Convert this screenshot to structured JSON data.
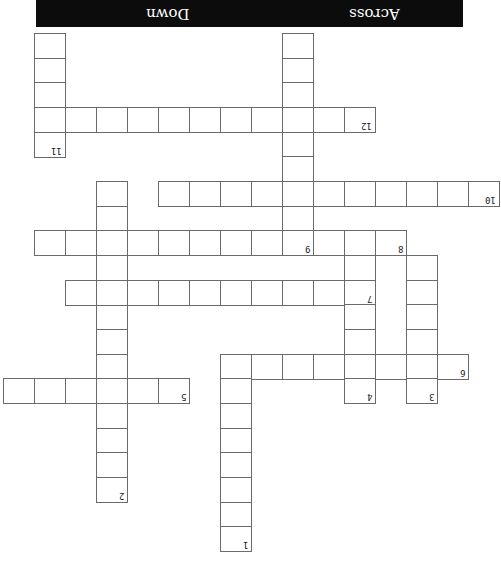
{
  "header": {
    "left_label": "Down",
    "right_label": "Across",
    "background": "#0c0c0c",
    "text_color": "#ffffff"
  },
  "orientation": "rotated-180",
  "cell_size": {
    "w": 31,
    "h": 24.6
  },
  "clues": [
    {
      "number": "1",
      "direction": "down"
    },
    {
      "number": "2",
      "direction": "down"
    },
    {
      "number": "3",
      "direction": "down"
    },
    {
      "number": "4",
      "direction": "down"
    },
    {
      "number": "5",
      "direction": "across"
    },
    {
      "number": "6",
      "direction": "across"
    },
    {
      "number": "7",
      "direction": "across"
    },
    {
      "number": "8",
      "direction": "down"
    },
    {
      "number": "9",
      "direction": "across"
    },
    {
      "number": "10",
      "direction": "across"
    },
    {
      "number": "11",
      "direction": "down"
    },
    {
      "number": "12",
      "direction": "across"
    }
  ],
  "cells": [
    {
      "x": 34,
      "y": 33
    },
    {
      "x": 34,
      "y": 58
    },
    {
      "x": 34,
      "y": 82
    },
    {
      "x": 34,
      "y": 107
    },
    {
      "x": 34,
      "y": 132,
      "n": "11"
    },
    {
      "x": 65,
      "y": 107
    },
    {
      "x": 96,
      "y": 107
    },
    {
      "x": 127,
      "y": 107
    },
    {
      "x": 158,
      "y": 107
    },
    {
      "x": 189,
      "y": 107
    },
    {
      "x": 220,
      "y": 107
    },
    {
      "x": 251,
      "y": 107
    },
    {
      "x": 282,
      "y": 107
    },
    {
      "x": 313,
      "y": 107
    },
    {
      "x": 344,
      "y": 107,
      "n": "12"
    },
    {
      "x": 282,
      "y": 33
    },
    {
      "x": 282,
      "y": 58
    },
    {
      "x": 282,
      "y": 82
    },
    {
      "x": 282,
      "y": 132
    },
    {
      "x": 282,
      "y": 156
    },
    {
      "x": 282,
      "y": 205
    },
    {
      "x": 158,
      "y": 181
    },
    {
      "x": 189,
      "y": 181
    },
    {
      "x": 220,
      "y": 181
    },
    {
      "x": 251,
      "y": 181
    },
    {
      "x": 282,
      "y": 181
    },
    {
      "x": 313,
      "y": 181
    },
    {
      "x": 344,
      "y": 181
    },
    {
      "x": 375,
      "y": 181
    },
    {
      "x": 406,
      "y": 181
    },
    {
      "x": 437,
      "y": 181
    },
    {
      "x": 468,
      "y": 181,
      "n": "10"
    },
    {
      "x": 96,
      "y": 181
    },
    {
      "x": 96,
      "y": 206
    },
    {
      "x": 96,
      "y": 255
    },
    {
      "x": 96,
      "y": 304
    },
    {
      "x": 96,
      "y": 329
    },
    {
      "x": 96,
      "y": 354
    },
    {
      "x": 96,
      "y": 403
    },
    {
      "x": 96,
      "y": 428
    },
    {
      "x": 96,
      "y": 452
    },
    {
      "x": 96,
      "y": 477,
      "n": "2"
    },
    {
      "x": 34,
      "y": 230
    },
    {
      "x": 65,
      "y": 230
    },
    {
      "x": 96,
      "y": 230
    },
    {
      "x": 127,
      "y": 230
    },
    {
      "x": 158,
      "y": 230
    },
    {
      "x": 189,
      "y": 230
    },
    {
      "x": 220,
      "y": 230
    },
    {
      "x": 251,
      "y": 230
    },
    {
      "x": 282,
      "y": 230,
      "n": "9"
    },
    {
      "x": 313,
      "y": 230
    },
    {
      "x": 344,
      "y": 230
    },
    {
      "x": 375,
      "y": 230,
      "n": "8"
    },
    {
      "x": 65,
      "y": 280
    },
    {
      "x": 96,
      "y": 280
    },
    {
      "x": 127,
      "y": 280
    },
    {
      "x": 158,
      "y": 280
    },
    {
      "x": 189,
      "y": 280
    },
    {
      "x": 220,
      "y": 280
    },
    {
      "x": 251,
      "y": 280
    },
    {
      "x": 282,
      "y": 280
    },
    {
      "x": 313,
      "y": 280
    },
    {
      "x": 344,
      "y": 280,
      "n": "7"
    },
    {
      "x": 344,
      "y": 255
    },
    {
      "x": 344,
      "y": 304
    },
    {
      "x": 344,
      "y": 329
    },
    {
      "x": 344,
      "y": 354
    },
    {
      "x": 344,
      "y": 378,
      "n": "4"
    },
    {
      "x": 406,
      "y": 255
    },
    {
      "x": 406,
      "y": 280
    },
    {
      "x": 406,
      "y": 304
    },
    {
      "x": 406,
      "y": 329
    },
    {
      "x": 406,
      "y": 354
    },
    {
      "x": 406,
      "y": 378,
      "n": "3"
    },
    {
      "x": 220,
      "y": 354
    },
    {
      "x": 251,
      "y": 354
    },
    {
      "x": 282,
      "y": 354
    },
    {
      "x": 313,
      "y": 354
    },
    {
      "x": 375,
      "y": 354
    },
    {
      "x": 437,
      "y": 354,
      "n": "6"
    },
    {
      "x": 3,
      "y": 378
    },
    {
      "x": 34,
      "y": 378
    },
    {
      "x": 65,
      "y": 378
    },
    {
      "x": 96,
      "y": 378
    },
    {
      "x": 127,
      "y": 378
    },
    {
      "x": 158,
      "y": 378,
      "n": "5"
    },
    {
      "x": 220,
      "y": 378
    },
    {
      "x": 220,
      "y": 403
    },
    {
      "x": 220,
      "y": 428
    },
    {
      "x": 220,
      "y": 452
    },
    {
      "x": 220,
      "y": 477
    },
    {
      "x": 220,
      "y": 502
    },
    {
      "x": 220,
      "y": 526,
      "n": "1"
    }
  ]
}
